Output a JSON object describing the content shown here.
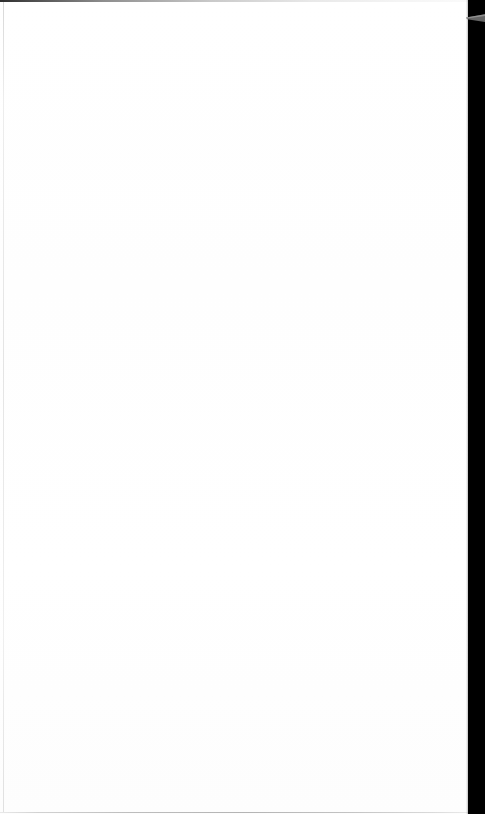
{
  "document": {
    "page_content_text": "",
    "page_state_label": "blank-page",
    "page_background_color": "#ffffff"
  },
  "page_edges": {
    "top_border_color": "#2e2e2e",
    "left_edge_color": "#e4e4e4",
    "bottom_edge_color": "#b4b4b4"
  },
  "surroundings": {
    "right_strip_color": "#000000",
    "wedge_color": "#6e6e6e",
    "wedge_label": "edge-wedge-marker"
  }
}
